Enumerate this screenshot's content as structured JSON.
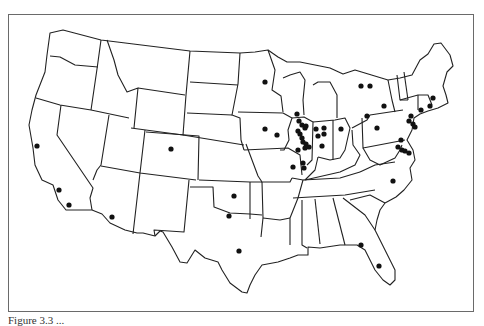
{
  "figure": {
    "type": "map",
    "region": "Contiguous United States (state outlines)",
    "caption": "Figure 3.3 ...",
    "marker_color": "#111111",
    "border_color": "#6a6a6a"
  },
  "markers": {
    "description": "Location dots",
    "count": 57,
    "points": [
      {
        "x": 37,
        "y": 146,
        "area": "California"
      },
      {
        "x": 59,
        "y": 190,
        "area": "California"
      },
      {
        "x": 69,
        "y": 205,
        "area": "California"
      },
      {
        "x": 112,
        "y": 217,
        "area": "Arizona"
      },
      {
        "x": 171,
        "y": 149,
        "area": "Colorado"
      },
      {
        "x": 234,
        "y": 196,
        "area": "Oklahoma"
      },
      {
        "x": 229,
        "y": 216,
        "area": "Texas"
      },
      {
        "x": 239,
        "y": 251,
        "area": "Texas"
      },
      {
        "x": 265,
        "y": 82,
        "area": "Minnesota"
      },
      {
        "x": 297,
        "y": 114,
        "area": "Wisconsin"
      },
      {
        "x": 265,
        "y": 129,
        "area": "Iowa"
      },
      {
        "x": 277,
        "y": 135,
        "area": "Iowa"
      },
      {
        "x": 299,
        "y": 121,
        "area": "Illinois"
      },
      {
        "x": 302,
        "y": 125,
        "area": "Illinois"
      },
      {
        "x": 305,
        "y": 128,
        "area": "Illinois"
      },
      {
        "x": 298,
        "y": 131,
        "area": "Illinois"
      },
      {
        "x": 300,
        "y": 134,
        "area": "Illinois"
      },
      {
        "x": 302,
        "y": 138,
        "area": "Illinois"
      },
      {
        "x": 303,
        "y": 142,
        "area": "Illinois"
      },
      {
        "x": 306,
        "y": 144,
        "area": "Illinois"
      },
      {
        "x": 309,
        "y": 147,
        "area": "Illinois"
      },
      {
        "x": 298,
        "y": 150,
        "area": "Illinois"
      },
      {
        "x": 305,
        "y": 148,
        "area": "Illinois"
      },
      {
        "x": 293,
        "y": 167,
        "area": "Illinois"
      },
      {
        "x": 303,
        "y": 163,
        "area": "Illinois"
      },
      {
        "x": 304,
        "y": 168,
        "area": "Illinois"
      },
      {
        "x": 306,
        "y": 126,
        "area": "Indiana"
      },
      {
        "x": 316,
        "y": 129,
        "area": "Indiana"
      },
      {
        "x": 324,
        "y": 128,
        "area": "Indiana"
      },
      {
        "x": 318,
        "y": 136,
        "area": "Indiana"
      },
      {
        "x": 324,
        "y": 134,
        "area": "Indiana"
      },
      {
        "x": 322,
        "y": 146,
        "area": "Indiana"
      },
      {
        "x": 341,
        "y": 129,
        "area": "Ohio"
      },
      {
        "x": 361,
        "y": 86,
        "area": "Ontario"
      },
      {
        "x": 370,
        "y": 86,
        "area": "Ontario"
      },
      {
        "x": 384,
        "y": 106,
        "area": "New York"
      },
      {
        "x": 367,
        "y": 116,
        "area": "Pennsylvania"
      },
      {
        "x": 377,
        "y": 128,
        "area": "Pennsylvania"
      },
      {
        "x": 411,
        "y": 116,
        "area": "New Jersey"
      },
      {
        "x": 409,
        "y": 121,
        "area": "New Jersey"
      },
      {
        "x": 413,
        "y": 124,
        "area": "New Jersey"
      },
      {
        "x": 415,
        "y": 127,
        "area": "New Jersey"
      },
      {
        "x": 401,
        "y": 140,
        "area": "Maryland"
      },
      {
        "x": 398,
        "y": 147,
        "area": "Maryland"
      },
      {
        "x": 402,
        "y": 150,
        "area": "Maryland"
      },
      {
        "x": 405,
        "y": 151,
        "area": "Delaware"
      },
      {
        "x": 409,
        "y": 153,
        "area": "Delaware"
      },
      {
        "x": 421,
        "y": 110,
        "area": "Connecticut"
      },
      {
        "x": 433,
        "y": 98,
        "area": "Massachusetts"
      },
      {
        "x": 430,
        "y": 106,
        "area": "Rhode Island"
      },
      {
        "x": 393,
        "y": 181,
        "area": "North Carolina"
      },
      {
        "x": 361,
        "y": 245,
        "area": "Florida"
      },
      {
        "x": 379,
        "y": 266,
        "area": "Florida"
      }
    ]
  }
}
